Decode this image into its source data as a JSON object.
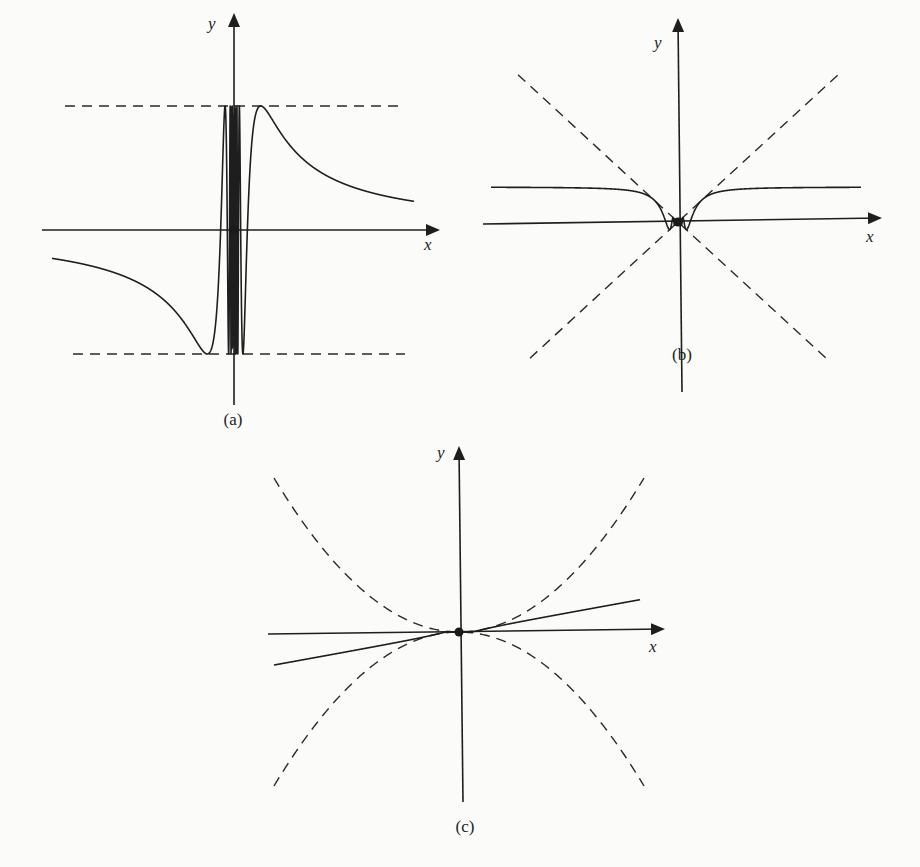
{
  "figure": {
    "panels": [
      {
        "id": "a",
        "caption": "(a)",
        "x_label": "x",
        "y_label": "y",
        "function": "sin(1/x)",
        "envelope": "y = ±1",
        "origin_px": [
          234,
          230
        ],
        "bounds_px": {
          "x_left": 52,
          "x_right": 414,
          "y_axis_top": 15,
          "y_axis_bottom": 405
        },
        "amplitude_px": 124,
        "freq_scale_px": 42,
        "x_axis_extent_px": [
          42,
          438
        ],
        "envelope_extent_px": [
          65,
          405
        ],
        "caption_pos_px": [
          233,
          405
        ]
      },
      {
        "id": "b",
        "caption": "(b)",
        "x_label": "x",
        "y_label": "y",
        "function": "x·sin(1/x)",
        "envelope": "y = ±x",
        "origin_px": [
          678,
          222
        ],
        "bounds_px": {
          "x_left": 491,
          "x_right": 861,
          "y_axis_top": 20,
          "y_axis_bottom": 392
        },
        "slope": 0.92,
        "freq_scale_px": 38,
        "x_axis_extent_px": [
          483,
          880
        ],
        "envelope_extent_px": [
          -160,
          150
        ],
        "caption_pos_px": [
          682,
          358
        ]
      },
      {
        "id": "c",
        "caption": "(c)",
        "x_label": "x",
        "y_label": "y",
        "function": "x²·sin(1/x)",
        "envelope": "y = ±x²",
        "origin_px": [
          459,
          632
        ],
        "bounds_px": {
          "x_left": 274,
          "x_right": 640,
          "y_axis_top": 448,
          "y_axis_bottom": 802
        },
        "curvature": 0.0045,
        "freq_scale_px": 40,
        "x_axis_extent_px": [
          268,
          663
        ],
        "envelope_extent_px": [
          -185,
          185
        ],
        "caption_pos_px": [
          465,
          830
        ]
      }
    ]
  },
  "chart_data": [
    {
      "type": "line",
      "title": "(a)",
      "xlabel": "x",
      "ylabel": "y",
      "series": [
        {
          "name": "y = sin(1/x)",
          "style": "solid"
        },
        {
          "name": "y = 1",
          "style": "dashed"
        },
        {
          "name": "y = -1",
          "style": "dashed"
        }
      ],
      "annotations": [
        "origin point marked with dot"
      ],
      "grid": false
    },
    {
      "type": "line",
      "title": "(b)",
      "xlabel": "x",
      "ylabel": "y",
      "series": [
        {
          "name": "y = x sin(1/x)",
          "style": "solid"
        },
        {
          "name": "y = x",
          "style": "dashed"
        },
        {
          "name": "y = -x",
          "style": "dashed"
        }
      ],
      "annotations": [
        "origin point marked with dot"
      ],
      "grid": false
    },
    {
      "type": "line",
      "title": "(c)",
      "xlabel": "x",
      "ylabel": "y",
      "series": [
        {
          "name": "y = x² sin(1/x)",
          "style": "solid"
        },
        {
          "name": "y = x²",
          "style": "dashed"
        },
        {
          "name": "y = -x²",
          "style": "dashed"
        }
      ],
      "annotations": [
        "origin point marked with dot"
      ],
      "grid": false
    }
  ]
}
